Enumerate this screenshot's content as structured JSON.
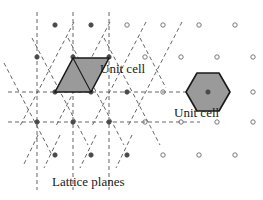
{
  "figure": {
    "background": "#ffffff",
    "width": 263,
    "height": 200
  },
  "labels": {
    "unit_cell_parallelogram": "Unit cell",
    "unit_cell_hexagon": "Unit cell",
    "lattice_planes": "Lattice planes"
  },
  "colors": {
    "line": "#3a3a3a",
    "dashed": "#555555",
    "cell_fill": "#9a9a9a",
    "cell_stroke": "#1a1a1a",
    "point_open_stroke": "#6b6b6b",
    "point_filled": "#4a4a4a",
    "text": "#1a1a1a"
  },
  "lattice": {
    "type": "oblique-2d",
    "row_spacing_y": 32.5,
    "point_spacing_x": 36,
    "row_offset_x": 18,
    "rows": [
      {
        "y": 25,
        "start_x": 55,
        "count": 6,
        "filled_upto_x": 91
      },
      {
        "y": 57,
        "start_x": 37,
        "count": 7,
        "filled_upto_x": 109
      },
      {
        "y": 92,
        "start_x": 55,
        "count": 6,
        "filled_upto_x": 163
      },
      {
        "y": 122,
        "start_x": 37,
        "count": 7,
        "filled_upto_x": 181
      },
      {
        "y": 155,
        "start_x": 55,
        "count": 6,
        "filled_upto_x": 127
      }
    ]
  },
  "lattice_planes": {
    "families": [
      {
        "name": "vertical",
        "orientation": "vertical",
        "x_positions": [
          37,
          73,
          109
        ],
        "y_from": 12,
        "y_to": 190
      },
      {
        "name": "horizontal",
        "orientation": "horizontal",
        "y_positions": [
          92,
          122
        ],
        "x_from": 8,
        "x_to": 200
      },
      {
        "name": "diagonal-down-right",
        "orientation": "diagonal",
        "slope": 1.9,
        "anchors_x": [
          19,
          55,
          91,
          127
        ],
        "anchor_y": 92,
        "extent": 45
      },
      {
        "name": "diagonal-down-left",
        "orientation": "diagonal",
        "slope": -1.9,
        "anchors_x": [
          55,
          91,
          127,
          163
        ],
        "anchor_y": 92,
        "extent": 45
      }
    ]
  },
  "unit_cells": [
    {
      "name": "parallelogram",
      "shape": "parallelogram",
      "vertices": "73,58 109,58 91,92 55,92",
      "fill": "#9a9a9a",
      "stroke": "#1a1a1a",
      "diagonal": "73,58 91,92"
    },
    {
      "name": "hexagon",
      "shape": "hexagon",
      "center_x": 208,
      "center_y": 92,
      "radius": 21,
      "fill": "#9a9a9a",
      "stroke": "#1a1a1a"
    }
  ]
}
